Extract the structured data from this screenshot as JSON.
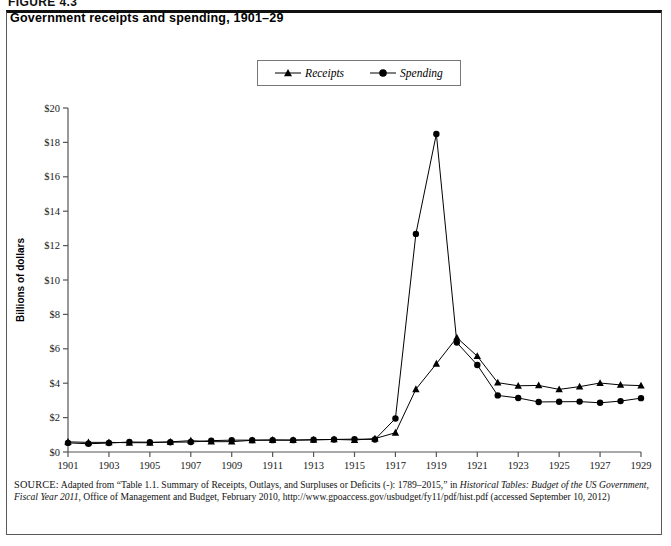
{
  "figure": {
    "number_label": "FIGURE 4.3",
    "title": "Government receipts and spending, 1901–29"
  },
  "legend": {
    "position": "top-center",
    "entries": [
      {
        "label": "Receipts",
        "marker": "triangle-marker-icon",
        "color": "#000000"
      },
      {
        "label": "Spending",
        "marker": "circle-marker-icon",
        "color": "#000000"
      }
    ]
  },
  "axes": {
    "y_title": "Billions of dollars",
    "y_ticks": [
      "$0",
      "$2",
      "$4",
      "$6",
      "$8",
      "$10",
      "$12",
      "$14",
      "$16",
      "$18",
      "$20"
    ],
    "x_ticks": [
      "1901",
      "1903",
      "1905",
      "1907",
      "1909",
      "1911",
      "1913",
      "1915",
      "1917",
      "1919",
      "1921",
      "1923",
      "1925",
      "1927",
      "1929"
    ]
  },
  "source": {
    "prefix": "SOURCE:",
    "text_1": " Adapted from “Table 1.1. Summary of Receipts, Outlays, and Surpluses or Deficits (-): 1789–2015,” in ",
    "italic_1": "Historical Tables: Budget of the US Government, Fiscal Year 2011",
    "text_2": ", Office of Management and Budget, February 2010, http://www.gpoaccess.gov/usbudget/fy11/pdf/hist.pdf (accessed September 10, 2012)"
  },
  "chart_data": {
    "type": "line",
    "title": "Government receipts and spending, 1901–29",
    "xlabel": "",
    "ylabel": "Billions of dollars",
    "xlim": [
      1901,
      1929
    ],
    "ylim": [
      0,
      20
    ],
    "ytick_step": 2,
    "xtick_step": 2,
    "grid": false,
    "legend_position": "top-center",
    "x": [
      1901,
      1902,
      1903,
      1904,
      1905,
      1906,
      1907,
      1908,
      1909,
      1910,
      1911,
      1912,
      1913,
      1914,
      1915,
      1916,
      1917,
      1918,
      1919,
      1920,
      1921,
      1922,
      1923,
      1924,
      1925,
      1926,
      1927,
      1928,
      1929
    ],
    "series": [
      {
        "name": "Receipts",
        "marker": "triangle",
        "color": "#000000",
        "values": [
          0.59,
          0.56,
          0.56,
          0.54,
          0.54,
          0.59,
          0.66,
          0.6,
          0.6,
          0.68,
          0.7,
          0.69,
          0.71,
          0.73,
          0.7,
          0.78,
          1.12,
          3.65,
          5.13,
          6.65,
          5.57,
          4.03,
          3.85,
          3.87,
          3.64,
          3.8,
          4.01,
          3.9,
          3.86
        ]
      },
      {
        "name": "Spending",
        "marker": "circle",
        "color": "#000000",
        "values": [
          0.53,
          0.48,
          0.52,
          0.58,
          0.57,
          0.57,
          0.58,
          0.66,
          0.69,
          0.69,
          0.69,
          0.69,
          0.71,
          0.73,
          0.75,
          0.73,
          1.95,
          12.68,
          18.49,
          6.36,
          5.06,
          3.29,
          3.14,
          2.91,
          2.92,
          2.93,
          2.86,
          2.96,
          3.13
        ]
      }
    ]
  }
}
